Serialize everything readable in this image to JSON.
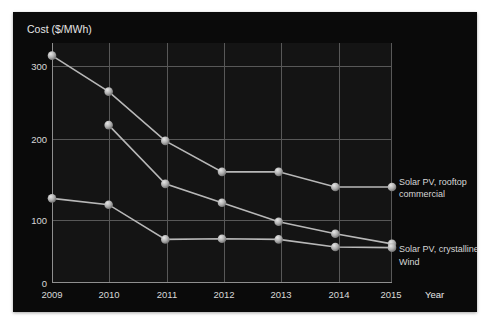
{
  "chart_data": {
    "type": "line",
    "title": "",
    "xlabel": "Year",
    "ylabel": "Cost ($/MWh)",
    "x": [
      2009,
      2010,
      2011,
      2012,
      2013,
      2014,
      2015
    ],
    "xticklabels": [
      "2009",
      "2010",
      "2011",
      "2012",
      "2013",
      "2014",
      "2015"
    ],
    "yticklabels": [
      "0",
      "100",
      "200",
      "300"
    ],
    "yticks": [
      0,
      100,
      200,
      300
    ],
    "ylim": [
      0,
      380
    ],
    "xlim": [
      2009,
      2015
    ],
    "grid": true,
    "legend_position": "right-inline",
    "series": [
      {
        "name": "Solar PV, rooftop commercial",
        "values": [
          360,
          303,
          225,
          176,
          176,
          152,
          152
        ]
      },
      {
        "name": "Solar PV, crystalline",
        "values": [
          null,
          250,
          157,
          127,
          97,
          78,
          62
        ]
      },
      {
        "name": "Wind",
        "values": [
          134,
          124,
          69,
          70,
          69,
          57,
          56
        ]
      }
    ]
  },
  "legend": {
    "rooftop_line1": "Solar PV, rooftop",
    "rooftop_line2": "commercial",
    "crystalline": "Solar PV, crystalline",
    "wind": "Wind"
  },
  "axes": {
    "y_title": "Cost ($/MWh)",
    "x_title": "Year"
  },
  "colors": {
    "background": "#0a0a0a",
    "plot_background": "#141414",
    "grid": "#585858",
    "axis": "#8f8f8f",
    "line": "#b8b8b8",
    "marker": "#b5b5b5",
    "text": "#d8d8d8"
  }
}
